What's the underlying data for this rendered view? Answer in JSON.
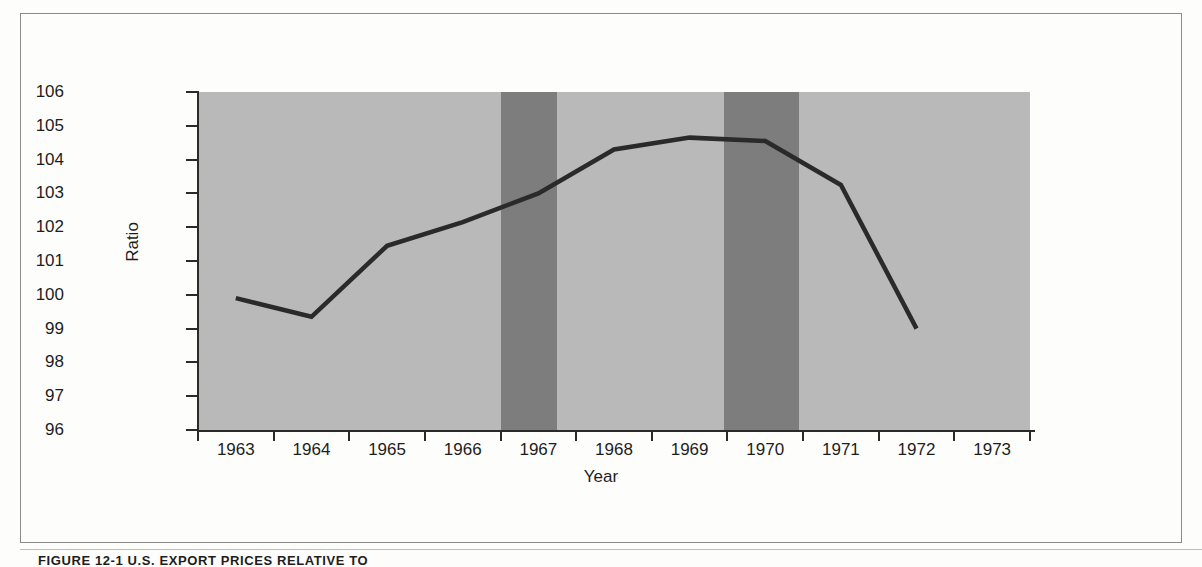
{
  "figure": {
    "caption": "FIGURE 12-1  U.S. EXPORT PRICES RELATIVE TO",
    "border_color": "#8a8a8a"
  },
  "colors": {
    "plot_background": "#b9b9b9",
    "recession_band": "#7d7d7d",
    "line": "#2a2a2a",
    "axis": "#2a2a2a",
    "text": "#1d1d1d",
    "page_background": "#fdfdfc"
  },
  "chart_data": {
    "type": "line",
    "title": "",
    "xlabel": "Year",
    "ylabel": "Ratio",
    "xlim": [
      1962.5,
      1973.5
    ],
    "ylim": [
      96,
      106
    ],
    "grid": false,
    "legend": null,
    "y_ticks": [
      96,
      97,
      98,
      99,
      100,
      101,
      102,
      103,
      104,
      105,
      106
    ],
    "x_ticks": [
      "1963",
      "1964",
      "1965",
      "1966",
      "1967",
      "1968",
      "1969",
      "1970",
      "1971",
      "1972",
      "1973"
    ],
    "x": [
      1963,
      1964,
      1965,
      1966,
      1967,
      1968,
      1969,
      1970,
      1971,
      1972
    ],
    "values": [
      99.9,
      99.35,
      101.45,
      102.15,
      103.0,
      104.3,
      104.65,
      104.55,
      103.25,
      99.0
    ],
    "series": [
      {
        "name": "Ratio",
        "x": [
          1963,
          1964,
          1965,
          1966,
          1967,
          1968,
          1969,
          1970,
          1971,
          1972
        ],
        "values": [
          99.9,
          99.35,
          101.45,
          102.15,
          103.0,
          104.3,
          104.65,
          104.55,
          103.25,
          99.0
        ]
      }
    ],
    "annotations": [
      {
        "type": "shaded-band",
        "name": "recession-band-1",
        "x_start": 1966.5,
        "x_end": 1967.25
      },
      {
        "type": "shaded-band",
        "name": "recession-band-2",
        "x_start": 1969.45,
        "x_end": 1970.45
      }
    ]
  }
}
